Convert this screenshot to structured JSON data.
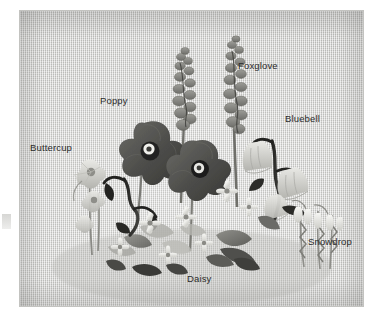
{
  "page": {
    "background_color": "#ffffff"
  },
  "photo": {
    "name": "silk-ribbon-embroidery-wildflower-sampler",
    "fabric_color": "#d4d4d1",
    "description": "Grayscale photograph of a silk-ribbon embroidered panel on linen showing six labelled garden wildflowers arranged in a bouquet",
    "bounds": {
      "left": 20,
      "top": 11,
      "width": 343,
      "height": 295
    }
  },
  "labels": [
    {
      "id": "foxglove",
      "text": "Foxglove",
      "x": 238,
      "y": 60,
      "points_to": "tall-spike-flowers-top-center"
    },
    {
      "id": "poppy",
      "text": "Poppy",
      "x": 100,
      "y": 95,
      "points_to": "large-dark-round-flowers-left-center"
    },
    {
      "id": "bluebell",
      "text": "Bluebell",
      "x": 285,
      "y": 113,
      "points_to": "pale-bell-flowers-right"
    },
    {
      "id": "buttercup",
      "text": "Buttercup",
      "x": 30,
      "y": 142,
      "points_to": "small-cup-flowers-far-left"
    },
    {
      "id": "snowdrop",
      "text": "Snowdrop",
      "x": 308,
      "y": 236,
      "points_to": "white-drooping-bells-lower-right"
    },
    {
      "id": "daisy",
      "text": "Daisy",
      "x": 187,
      "y": 273,
      "points_to": "small-star-flowers-bottom-center"
    }
  ],
  "flowers": [
    {
      "name": "Foxglove",
      "count": 2,
      "color": "#7d7d79",
      "form": "tall bumpy spike"
    },
    {
      "name": "Poppy",
      "count": 2,
      "color": "#5a5a57",
      "form": "broad four-petal bloom with dark centre"
    },
    {
      "name": "Bluebell",
      "count": 3,
      "color": "#b9b9b4",
      "form": "nodding bell on dark stem"
    },
    {
      "name": "Buttercup",
      "count": 3,
      "color": "#aeaea9",
      "form": "small round cup"
    },
    {
      "name": "Snowdrop",
      "count": 4,
      "color": "#e6e6e2",
      "form": "white drooping bell"
    },
    {
      "name": "Daisy",
      "count": 7,
      "color": "#c8c8c3",
      "form": "small five-petal star"
    }
  ],
  "colors": {
    "label_text": "#2b2b2b",
    "fabric": "#d4d4d1",
    "dark_foliage": "#2e2e2c",
    "mid_foliage": "#8d8d88",
    "petal_dark": "#4e4e4b",
    "petal_light": "#e2e2de",
    "page": "#ffffff"
  }
}
